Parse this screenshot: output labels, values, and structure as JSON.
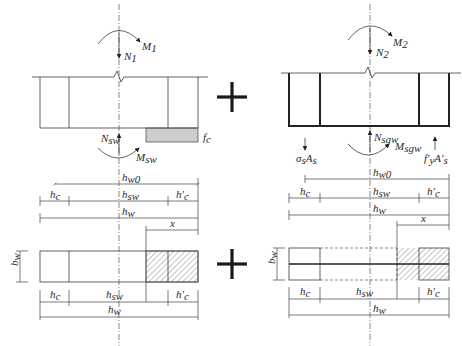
{
  "diagram": {
    "type": "superposition of wall section force diagrams",
    "operator": "+",
    "left_panel": {
      "axial_force": "N",
      "axial_force_sub": "1",
      "moment": "M",
      "moment_sub": "1",
      "web_axial": "N",
      "web_axial_sub": "sw",
      "web_moment": "M",
      "web_moment_sub": "sw",
      "concrete_stress": "f",
      "concrete_stress_sub": "c"
    },
    "right_panel": {
      "axial_force": "N",
      "axial_force_sub": "2",
      "moment": "M",
      "moment_sub": "2",
      "web_axial": "N",
      "web_axial_sub": "sgw",
      "web_moment": "M",
      "web_moment_sub": "sgw",
      "tension_steel": "σ",
      "tension_steel_sub": "s",
      "tension_steel_area": "A",
      "tension_steel_area_sub": "s",
      "comp_steel": "f′",
      "comp_steel_sub": "y",
      "comp_steel_area": "A′",
      "comp_steel_area_sub": "s"
    },
    "dimensions": {
      "h": "h",
      "w0": "w0",
      "c": "c",
      "sw": "sw",
      "c_prime": "c",
      "w": "w",
      "x": "x",
      "b": "b",
      "bw_sub": "w"
    }
  }
}
